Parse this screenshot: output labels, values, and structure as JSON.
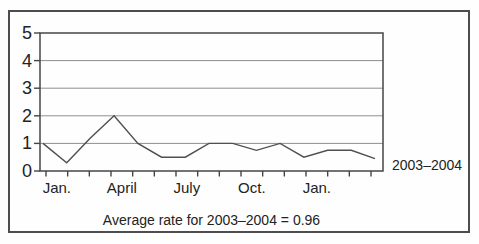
{
  "figure": {
    "series_label": "2003–2004",
    "caption": "Average rate for 2003–2004 = 0.96"
  },
  "colors": {
    "line": "#4f4f4f",
    "grid": "#8f8f8f",
    "frame": "#454545",
    "tick": "#454545",
    "text": "#232323"
  },
  "chart_data": {
    "type": "line",
    "x": [
      "Jan 2003",
      "Feb 2003",
      "Mar 2003",
      "Apr 2003",
      "May 2003",
      "Jun 2003",
      "Jul 2003",
      "Aug 2003",
      "Sep 2003",
      "Oct 2003",
      "Nov 2003",
      "Dec 2003",
      "Jan 2004",
      "Feb 2004",
      "Mar 2004"
    ],
    "values": [
      1.0,
      0.3,
      1.2,
      2.0,
      1.0,
      0.5,
      0.5,
      1.0,
      1.0,
      0.75,
      1.0,
      0.5,
      0.75,
      0.75,
      0.45
    ],
    "title": "",
    "xlabel": "",
    "ylabel": "",
    "ylim": [
      0,
      5
    ],
    "yticks": [
      0,
      1,
      2,
      3,
      4,
      5
    ],
    "x_tick_count": 16,
    "x_axis_labels": [
      {
        "text": "Jan.",
        "bin": 0
      },
      {
        "text": "April",
        "bin": 3
      },
      {
        "text": "July",
        "bin": 6
      },
      {
        "text": "Oct.",
        "bin": 9
      },
      {
        "text": "Jan.",
        "bin": 12
      }
    ],
    "grid": "horizontal",
    "legend": "none",
    "annotations": [
      "2003–2004",
      "Average rate for 2003–2004 = 0.96"
    ]
  }
}
